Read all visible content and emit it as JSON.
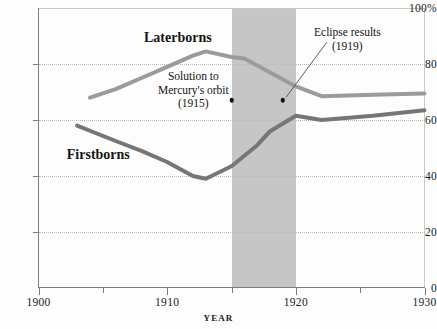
{
  "chart_data": {
    "type": "line",
    "title": "",
    "xlabel": "YEAR",
    "ylabel": "",
    "xlim": [
      1900,
      1930
    ],
    "ylim": [
      0,
      100
    ],
    "grid": true,
    "legend_position": "inline-labels",
    "x_ticks": [
      {
        "value": 1900,
        "label": "1900",
        "major": true
      },
      {
        "value": 1905,
        "label": "",
        "major": false
      },
      {
        "value": 1910,
        "label": "1910",
        "major": true
      },
      {
        "value": 1915,
        "label": "",
        "major": false
      },
      {
        "value": 1920,
        "label": "1920",
        "major": true
      },
      {
        "value": 1925,
        "label": "",
        "major": false
      },
      {
        "value": 1930,
        "label": "1930",
        "major": true
      }
    ],
    "y_ticks": [
      {
        "value": 0,
        "label": "0"
      },
      {
        "value": 20,
        "label": "20"
      },
      {
        "value": 40,
        "label": "40"
      },
      {
        "value": 60,
        "label": "60"
      },
      {
        "value": 80,
        "label": "80"
      },
      {
        "value": 100,
        "label": "100%"
      }
    ],
    "gridline_values": [
      20,
      40,
      60,
      80
    ],
    "series": [
      {
        "name": "Laterborns",
        "color": "#9b9b9b",
        "label_x": 1908.2,
        "label_y": 89,
        "x": [
          1904,
          1906,
          1908,
          1910,
          1912,
          1913,
          1915,
          1916,
          1918,
          1920,
          1922,
          1926,
          1930
        ],
        "values": [
          68,
          71,
          75,
          79,
          83,
          84.5,
          82.5,
          82,
          77,
          72,
          68.5,
          69,
          69.5
        ]
      },
      {
        "name": "Firstborns",
        "color": "#767676",
        "label_x": 1902.2,
        "label_y": 47,
        "x": [
          1903,
          1906,
          1908,
          1910,
          1912,
          1913,
          1915,
          1917,
          1918,
          1920,
          1922,
          1926,
          1930
        ],
        "values": [
          58,
          52.5,
          49,
          45,
          40,
          39,
          43.5,
          51,
          56,
          61.5,
          60,
          61.5,
          63.5
        ]
      }
    ],
    "shaded_regions": [
      {
        "name": "wartime-band",
        "x_start": 1915,
        "x_end": 1920,
        "color": "#c6c6c6"
      }
    ],
    "annotations": [
      {
        "name": "mercury-orbit",
        "line1": "Solution to",
        "line2": "Mercury's orbit",
        "line3": "(1915)",
        "point_x": 1915,
        "point_y": 67,
        "has_leader": false
      },
      {
        "name": "eclipse-results",
        "line1": "Eclipse results",
        "line2": "(1919)",
        "line3": "",
        "point_x": 1919,
        "point_y": 67,
        "has_leader": true
      }
    ]
  }
}
